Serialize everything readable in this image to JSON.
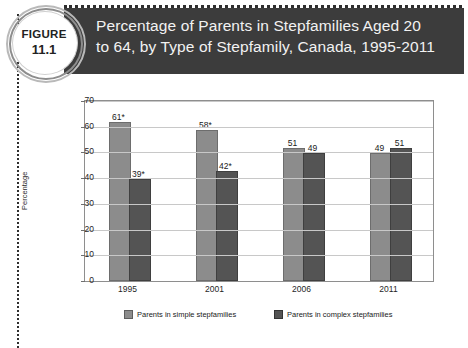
{
  "figure": {
    "badge_word": "FIGURE",
    "badge_number": "11.1",
    "title": "Percentage of Parents in Stepfamilies Aged 20\nto 64, by Type of Stepfamily, Canada, 1995-2011"
  },
  "colors": {
    "banner": "#3c3c3c",
    "simple": "#8c8c8c",
    "complex": "#545454",
    "grid": "#c8c8c8",
    "frame": "#8e8e8e"
  },
  "chart_data": {
    "type": "bar",
    "title": "",
    "xlabel": "",
    "ylabel": "Percentage",
    "categories": [
      "1995",
      "2001",
      "2006",
      "2011"
    ],
    "ylim": [
      0,
      70
    ],
    "yticks": [
      "0",
      "10",
      "20",
      "30",
      "40",
      "50",
      "60",
      "70"
    ],
    "grid": true,
    "legend_position": "bottom",
    "series": [
      {
        "name": "Parents in simple stepfamilies",
        "values": [
          61,
          58,
          51,
          49
        ],
        "labels": [
          "61*",
          "58*",
          "51",
          "49"
        ]
      },
      {
        "name": "Parents in complex stepfamilies",
        "values": [
          39,
          42,
          49,
          51
        ],
        "labels": [
          "39*",
          "42*",
          "49",
          "51"
        ]
      }
    ]
  }
}
